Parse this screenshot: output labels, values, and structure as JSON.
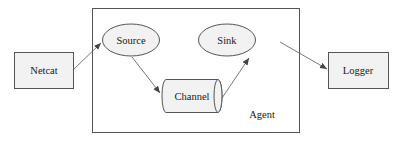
{
  "diagram": {
    "container": {
      "label": "Agent"
    },
    "nodes": {
      "netcat": {
        "label": "Netcat",
        "shape": "rectangle",
        "fill": "#f2f2f2"
      },
      "source": {
        "label": "Source",
        "shape": "ellipse",
        "fill": "#f2f2f2"
      },
      "channel": {
        "label": "Channel",
        "shape": "cylinder",
        "fill": "#f2f2f2"
      },
      "sink": {
        "label": "Sink",
        "shape": "ellipse",
        "fill": "#f2f2f2"
      },
      "logger": {
        "label": "Logger",
        "shape": "rectangle",
        "fill": "#f2f2f2"
      }
    },
    "edges": [
      {
        "from": "Netcat",
        "to": "Source"
      },
      {
        "from": "Source",
        "to": "Channel"
      },
      {
        "from": "Channel",
        "to": "Sink"
      },
      {
        "from": "Sink",
        "to": "Logger"
      }
    ],
    "colors": {
      "stroke": "#555555",
      "fill": "#f2f2f2",
      "text": "#1a1a1a",
      "background": "#ffffff"
    }
  }
}
